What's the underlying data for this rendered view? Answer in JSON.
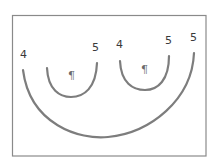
{
  "diagram": {
    "type": "nested-arcs",
    "frame": {
      "x": 12.5,
      "y": 15.5,
      "width": 193.5,
      "height": 140.5
    },
    "colors": {
      "frame": "#8a8a8a",
      "arc": "#7d7d7d",
      "label": "#3a3a3a",
      "symbol": "#6a6a6a"
    },
    "arcs": [
      {
        "id": "outer-arc",
        "start": {
          "x": 23,
          "y": 70
        },
        "bottom": {
          "x": 100,
          "y": 137
        },
        "end": {
          "x": 194,
          "y": 53
        },
        "start_label": "4",
        "end_label": "5"
      },
      {
        "id": "inner-arc-1",
        "start": {
          "x": 47,
          "y": 68
        },
        "bottom": {
          "x": 70,
          "y": 97
        },
        "end": {
          "x": 97,
          "y": 63
        },
        "start_label": "",
        "end_label": "5",
        "symbol": "¶"
      },
      {
        "id": "inner-arc-2",
        "start": {
          "x": 120,
          "y": 61
        },
        "bottom": {
          "x": 145,
          "y": 90
        },
        "end": {
          "x": 169,
          "y": 56
        },
        "start_label": "4",
        "end_label": "5",
        "symbol": "¶"
      }
    ],
    "labels": [
      {
        "id": "label-outer-start",
        "text": "4",
        "x": 20,
        "y": 58
      },
      {
        "id": "label-inner1-end",
        "text": "5",
        "x": 92,
        "y": 51
      },
      {
        "id": "label-inner2-start",
        "text": "4",
        "x": 116,
        "y": 48
      },
      {
        "id": "label-inner2-end",
        "text": "5",
        "x": 165,
        "y": 44
      },
      {
        "id": "label-outer-end",
        "text": "5",
        "x": 190,
        "y": 41
      }
    ],
    "symbols": [
      {
        "id": "pilcrow-1",
        "text": "¶",
        "x": 68,
        "y": 79
      },
      {
        "id": "pilcrow-2",
        "text": "¶",
        "x": 141,
        "y": 73
      }
    ]
  }
}
